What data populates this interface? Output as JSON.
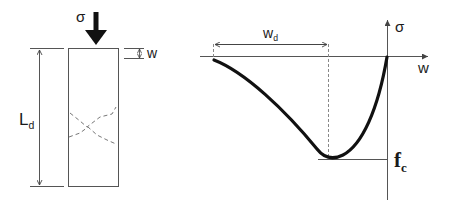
{
  "specimen": {
    "stress_label": "σ",
    "length_label": "L",
    "length_sub": "d",
    "displacement_label": "w"
  },
  "plot": {
    "y_axis_label": "σ",
    "x_axis_label": "w",
    "damage_zone_label": "w",
    "damage_zone_sub": "d",
    "peak_label": "f",
    "peak_sub": "c"
  },
  "colors": {
    "line": "#1a1a1a",
    "thin": "#555555",
    "dashed": "#777777"
  }
}
